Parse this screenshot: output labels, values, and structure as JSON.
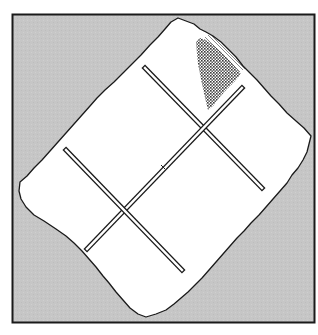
{
  "figure": {
    "colors": {
      "page_background": "#ffffff",
      "frame_fill": "#c4c4c4",
      "frame_stroke": "#1a1a1a",
      "paper_fill": "#ffffff",
      "paper_stroke": "#1a1a1a",
      "bar_fill": "#ffffff",
      "bar_stroke": "#1a1a1a",
      "hatch_color": "#3a3a3a"
    },
    "frame": {
      "x": 12,
      "y": 14,
      "width": 303,
      "height": 309
    },
    "bars": [
      {
        "name": "bar-upper-right",
        "x1": 145,
        "y1": 68,
        "x2": 262,
        "y2": 188
      },
      {
        "name": "bar-long-diagonal",
        "x1": 242,
        "y1": 88,
        "x2": 87,
        "y2": 249
      },
      {
        "name": "bar-lower-left",
        "x1": 66,
        "y1": 150,
        "x2": 182,
        "y2": 270
      }
    ]
  }
}
